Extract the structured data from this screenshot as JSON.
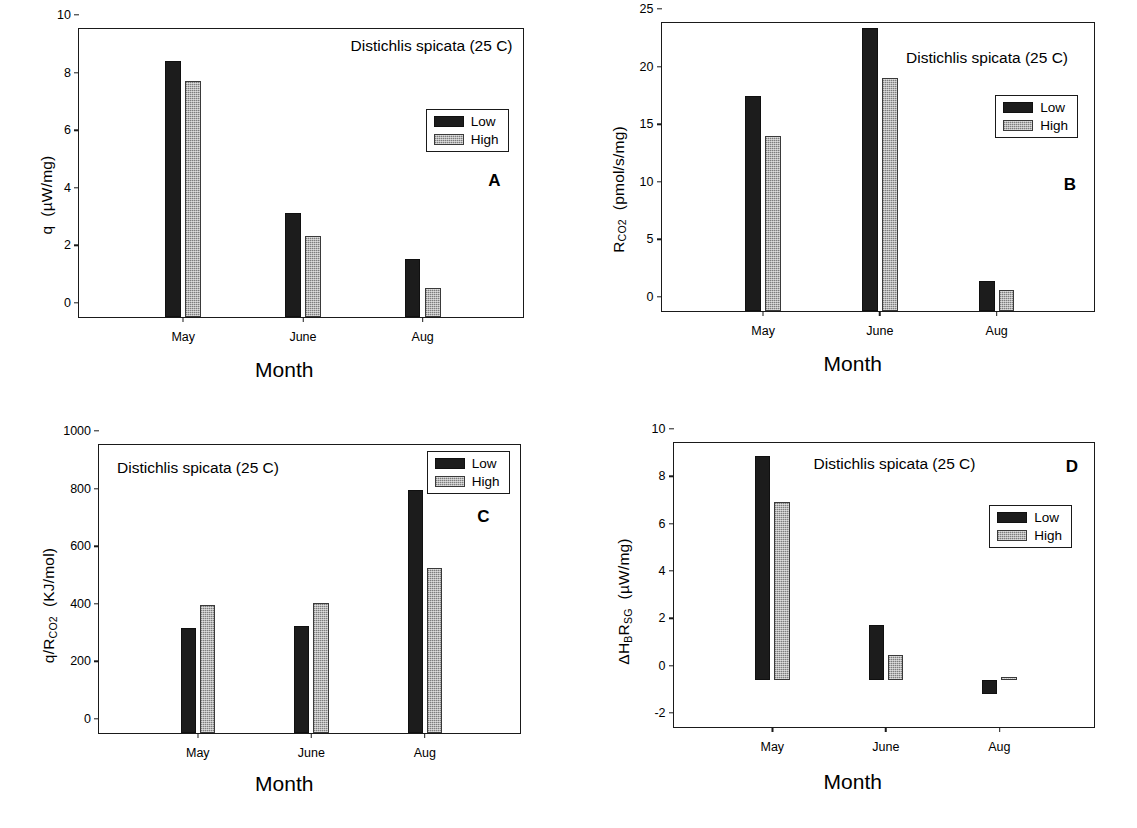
{
  "figure": {
    "species_title": "Distichlis spicata (25 C)",
    "x_axis_title": "Month",
    "legend": {
      "low": "Low",
      "high": "High"
    },
    "colors": {
      "low": "#1c1c1c",
      "high": "#b4b4b4",
      "axis": "#1a1a1a"
    }
  },
  "panels": {
    "a": {
      "letter": "A",
      "y_title_main": "q",
      "y_title_unit": "(µW/mg)",
      "yticks": [
        "0",
        "2",
        "4",
        "6",
        "8",
        "10"
      ],
      "xticks": [
        "May",
        "June",
        "Aug"
      ]
    },
    "b": {
      "letter": "B",
      "y_title_main": "R",
      "y_title_sub": "CO2",
      "y_title_unit": "(pmol/s/mg)",
      "yticks": [
        "0",
        "5",
        "10",
        "15",
        "20",
        "25"
      ],
      "xticks": [
        "May",
        "June",
        "Aug"
      ]
    },
    "c": {
      "letter": "C",
      "y_title_main": "q/R",
      "y_title_sub": "CO2",
      "y_title_unit": "(KJ/mol)",
      "yticks": [
        "0",
        "200",
        "400",
        "600",
        "800",
        "1000"
      ],
      "xticks": [
        "May",
        "June",
        "Aug"
      ]
    },
    "d": {
      "letter": "D",
      "y_title_main": "ΔH",
      "y_title_sub1": "B",
      "y_title_mid": "R",
      "y_title_sub2": "SG",
      "y_title_unit": "(µW/mg)",
      "yticks": [
        "-2",
        "0",
        "2",
        "4",
        "6",
        "8",
        "10"
      ],
      "xticks": [
        "May",
        "June",
        "Aug"
      ]
    }
  },
  "chart_data": [
    {
      "type": "bar",
      "panel": "A",
      "title": "Distichlis spicata (25 C)",
      "xlabel": "Month",
      "ylabel": "q  (µW/mg)",
      "categories": [
        "May",
        "June",
        "Aug"
      ],
      "ylim": [
        0,
        10
      ],
      "yticks": [
        0,
        2,
        4,
        6,
        8,
        10
      ],
      "grid": false,
      "legend_position": "top-right",
      "series": [
        {
          "name": "Low",
          "values": [
            8.9,
            3.6,
            2.0
          ]
        },
        {
          "name": "High",
          "values": [
            8.2,
            2.8,
            1.0
          ]
        }
      ]
    },
    {
      "type": "bar",
      "panel": "B",
      "title": "Distichlis spicata (25 C)",
      "xlabel": "Month",
      "ylabel": "R_CO2  (pmol/s/mg)",
      "categories": [
        "May",
        "June",
        "Aug"
      ],
      "ylim": [
        0,
        25
      ],
      "yticks": [
        0,
        5,
        10,
        15,
        20,
        25
      ],
      "grid": false,
      "legend_position": "top-right",
      "series": [
        {
          "name": "Low",
          "values": [
            18.7,
            24.6,
            2.6
          ]
        },
        {
          "name": "High",
          "values": [
            15.2,
            20.2,
            1.8
          ]
        }
      ]
    },
    {
      "type": "bar",
      "panel": "C",
      "title": "Distichlis spicata (25 C)",
      "xlabel": "Month",
      "ylabel": "q/R_CO2  (KJ/mol)",
      "categories": [
        "May",
        "June",
        "Aug"
      ],
      "ylim": [
        0,
        1000
      ],
      "yticks": [
        0,
        200,
        400,
        600,
        800,
        1000
      ],
      "grid": false,
      "legend_position": "top-right",
      "series": [
        {
          "name": "Low",
          "values": [
            365,
            370,
            843
          ]
        },
        {
          "name": "High",
          "values": [
            445,
            450,
            573
          ]
        }
      ]
    },
    {
      "type": "bar",
      "panel": "D",
      "title": "Distichlis spicata (25 C)",
      "xlabel": "Month",
      "ylabel": "ΔH_B R_SG  (µW/mg)",
      "categories": [
        "May",
        "June",
        "Aug"
      ],
      "ylim": [
        -2,
        10
      ],
      "yticks": [
        -2,
        0,
        2,
        4,
        6,
        8,
        10
      ],
      "grid": false,
      "legend_position": "top-right",
      "series": [
        {
          "name": "Low",
          "values": [
            9.45,
            2.3,
            -0.6
          ]
        },
        {
          "name": "High",
          "values": [
            7.5,
            1.05,
            0.1
          ]
        }
      ]
    }
  ]
}
